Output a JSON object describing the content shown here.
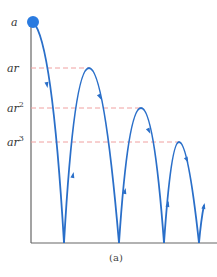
{
  "figure": {
    "caption": "(a)",
    "labels": {
      "a": "a",
      "ar": "ar",
      "ar2_base": "ar",
      "ar2_exp": "2",
      "ar3_base": "ar",
      "ar3_exp": "3"
    },
    "colors": {
      "trajectory": "#2a6fc9",
      "ball": "#2a7be0",
      "guide_lines": "#f0a0a0",
      "axis": "#666666"
    }
  }
}
